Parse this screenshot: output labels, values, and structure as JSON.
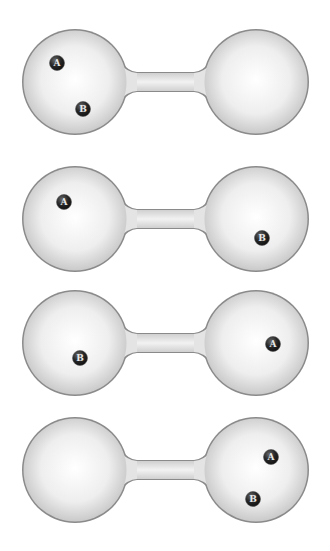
{
  "diagrams": [
    {
      "panel": 1,
      "cy": 82,
      "particles": [
        {
          "label": "A",
          "x": 57,
          "y": 63
        },
        {
          "label": "B",
          "x": 83,
          "y": 109
        }
      ]
    },
    {
      "panel": 2,
      "cy": 219,
      "particles": [
        {
          "label": "A",
          "x": 64,
          "y": 202
        },
        {
          "label": "B",
          "x": 262,
          "y": 238
        }
      ]
    },
    {
      "panel": 3,
      "cy": 343,
      "particles": [
        {
          "label": "B",
          "x": 80,
          "y": 358
        },
        {
          "label": "A",
          "x": 273,
          "y": 344
        }
      ]
    },
    {
      "panel": 4,
      "cy": 470,
      "particles": [
        {
          "label": "A",
          "x": 271,
          "y": 457
        },
        {
          "label": "B",
          "x": 253,
          "y": 499
        }
      ]
    }
  ],
  "geometry": {
    "left_cx": 75,
    "right_cx": 256,
    "radius": 52,
    "tube_half_height": 9
  },
  "colors": {
    "bulb_fill": "#ececec",
    "bulb_stroke": "#8a8a8a",
    "particle": "#2a2a2a"
  }
}
